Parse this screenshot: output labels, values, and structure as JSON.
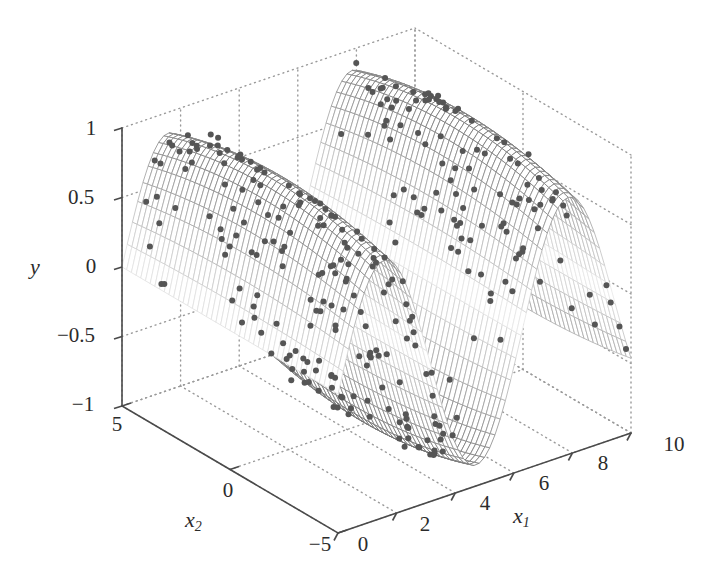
{
  "figure": {
    "background_color": "#ffffff",
    "axis_color": "#4a4a4a",
    "grid_color": "#9a9a9a",
    "mesh_color_light": "#e8e8e8",
    "mesh_color_dark": "#6f6f6f",
    "point_color": "#555555"
  },
  "axes": {
    "y": {
      "label": "y",
      "ticks": [
        "1",
        "0.5",
        "0",
        "−0.5",
        "−1"
      ],
      "tick_values": [
        1,
        0.5,
        0,
        -0.5,
        -1
      ],
      "range": [
        -1,
        1
      ]
    },
    "x1": {
      "label_base": "x",
      "label_sub": "1",
      "ticks": [
        "0",
        "2",
        "4",
        "6",
        "8",
        "10"
      ],
      "tick_values": [
        0,
        2,
        4,
        6,
        8,
        10
      ],
      "range": [
        0,
        10
      ]
    },
    "x2": {
      "label_base": "x",
      "label_sub": "2",
      "ticks": [
        "5",
        "0",
        "−5"
      ],
      "tick_values": [
        5,
        0,
        -5
      ],
      "range": [
        -5,
        5
      ]
    }
  },
  "chart_data": {
    "type": "scatter",
    "title": "",
    "xlabel": "x1",
    "ylabel": "x2",
    "zlabel": "y",
    "xlim": [
      0,
      10
    ],
    "ylim": [
      -5,
      5
    ],
    "zlim": [
      -1,
      1
    ],
    "grid": true,
    "legend": "none",
    "view": {
      "azimuth": -37.5,
      "elevation": 30
    },
    "surface": {
      "description": "Wireframe mesh surface over x1 in [0,10], x2 in [-5,5]; y = sin(x1) * exp(-x2^2/40) shaped ridge peaking near x1=1.6 and trough near x1=7.9",
      "formula": "y = sin(x1) * (1 - 0.15*(x2/5)^2)",
      "grid_n1": 56,
      "grid_n2": 46,
      "zmax": 1.0,
      "zmin": -1.0,
      "shading": "grayscale-by-height"
    },
    "points": {
      "description": "Noisy sample observations scattered on the surface",
      "count": 300,
      "marker": "dot",
      "marker_size": 6,
      "color": "#555555",
      "noise_sigma": 0.04
    }
  }
}
